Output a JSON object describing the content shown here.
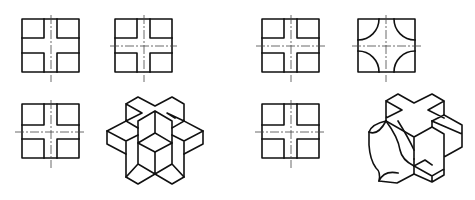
{
  "figure": {
    "colors": {
      "line": "#111111",
      "centerline": "#444444",
      "background": "#ffffff"
    },
    "groups": [
      {
        "name": "left-group",
        "views": [
          {
            "name": "front-view",
            "shape": "square-with-cross-cutouts",
            "centerlines": [
              "vertical"
            ]
          },
          {
            "name": "side-view",
            "shape": "square-with-cross-cutouts",
            "centerlines": [
              "vertical",
              "horizontal"
            ]
          },
          {
            "name": "top-view",
            "shape": "square-with-cross-cutouts",
            "centerlines": [
              "vertical",
              "horizontal"
            ]
          },
          {
            "name": "isometric-view",
            "shape": "double-cross-solid"
          }
        ]
      },
      {
        "name": "right-group",
        "views": [
          {
            "name": "front-view",
            "shape": "square-with-cross-cutouts",
            "centerlines": [
              "vertical",
              "horizontal"
            ]
          },
          {
            "name": "side-view",
            "shape": "square-with-quarter-arc-corners",
            "centerlines": [
              "vertical",
              "horizontal"
            ]
          },
          {
            "name": "top-view",
            "shape": "square-with-cross-cutouts",
            "centerlines": [
              "vertical",
              "horizontal"
            ]
          },
          {
            "name": "isometric-view",
            "shape": "cross-solid-with-curved-cutouts"
          }
        ]
      }
    ]
  }
}
